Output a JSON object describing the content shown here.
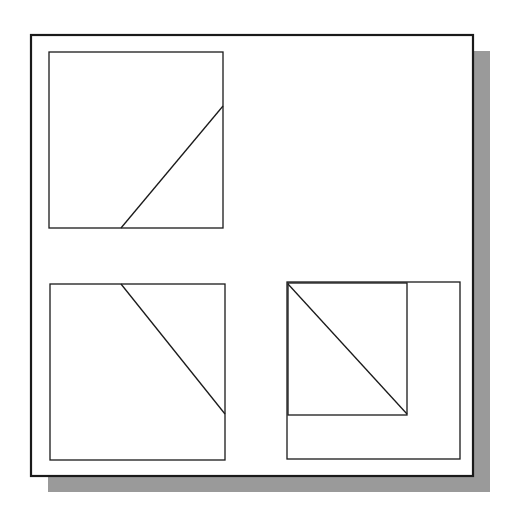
{
  "canvas": {
    "width": 511,
    "height": 521,
    "background": "#ffffff"
  },
  "colors": {
    "stroke": "#1a1a1a",
    "shadow": "#9a9a9a",
    "paper": "#ffffff"
  },
  "frame": {
    "x": 31,
    "y": 35,
    "w": 442,
    "h": 441,
    "stroke_width": 2.2
  },
  "shadow": {
    "dx": 17,
    "dy": 16
  },
  "views": [
    {
      "name": "top-left-view",
      "rect": {
        "x": 49,
        "y": 52,
        "w": 174,
        "h": 176
      },
      "lines": [
        {
          "x1": 121,
          "y1": 228,
          "x2": 223,
          "y2": 106
        }
      ]
    },
    {
      "name": "bottom-left-view",
      "rect": {
        "x": 50,
        "y": 284,
        "w": 175,
        "h": 176
      },
      "lines": [
        {
          "x1": 121,
          "y1": 284,
          "x2": 225,
          "y2": 414
        }
      ]
    },
    {
      "name": "bottom-right-view",
      "rect": {
        "x": 287,
        "y": 282,
        "w": 173,
        "h": 177
      },
      "inner_rect": {
        "x": 288,
        "y": 283,
        "w": 119,
        "h": 132
      },
      "lines": [
        {
          "x1": 288,
          "y1": 284,
          "x2": 407,
          "y2": 414
        }
      ]
    }
  ]
}
